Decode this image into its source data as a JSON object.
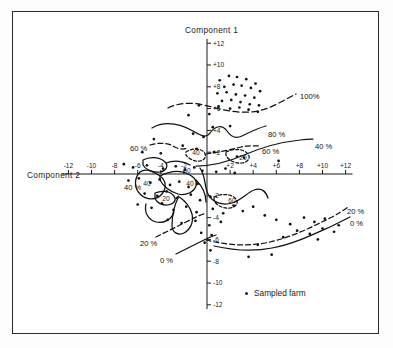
{
  "figure": {
    "axis_title_y": "Component 1",
    "axis_title_x": "Component 2",
    "legend_label": "Sampled farm",
    "legend_marker": "dot-marker"
  },
  "chart_data": {
    "type": "scatter",
    "title": "",
    "xlabel": "Component 2",
    "ylabel": "Component 1",
    "xlim": [
      -13,
      13
    ],
    "ylim": [
      -13,
      13
    ],
    "grid": false,
    "legend_position": "bottom-center",
    "legend": [
      {
        "label": "Sampled farm",
        "marker": "dot",
        "color": "#111111"
      }
    ],
    "x_ticks": [
      -12,
      -10,
      -8,
      -6,
      -4,
      -2,
      2,
      4,
      6,
      8,
      10,
      12
    ],
    "x_tick_labels": [
      "-12",
      "-10",
      "-8",
      "-6",
      "-4",
      "-2",
      "+2",
      "+4",
      "+6",
      "+8",
      "+10",
      "+12"
    ],
    "y_ticks": [
      -12,
      -10,
      -8,
      -6,
      -4,
      -2,
      2,
      4,
      6,
      8,
      10,
      12
    ],
    "y_tick_labels": [
      "-12",
      "-10",
      "-8",
      "-6",
      "-4",
      "-2",
      "+2",
      "+4",
      "+6",
      "+8",
      "+10",
      "+12"
    ],
    "series": [
      {
        "name": "Sampled farm",
        "marker": "dot",
        "points": [
          [
            1.1,
            8.6
          ],
          [
            1.9,
            9.0
          ],
          [
            2.6,
            8.9
          ],
          [
            3.4,
            8.7
          ],
          [
            4.2,
            8.3
          ],
          [
            1.5,
            8.0
          ],
          [
            2.3,
            8.2
          ],
          [
            3.0,
            8.1
          ],
          [
            3.8,
            7.9
          ],
          [
            4.6,
            7.6
          ],
          [
            0.9,
            7.4
          ],
          [
            1.7,
            7.5
          ],
          [
            2.5,
            7.3
          ],
          [
            3.3,
            7.2
          ],
          [
            4.1,
            7.0
          ],
          [
            1.3,
            6.7
          ],
          [
            2.1,
            6.8
          ],
          [
            2.9,
            6.6
          ],
          [
            3.7,
            6.4
          ],
          [
            4.5,
            6.3
          ],
          [
            2.0,
            6.0
          ],
          [
            2.8,
            6.1
          ],
          [
            3.6,
            5.9
          ],
          [
            4.4,
            5.7
          ],
          [
            1.0,
            6.2
          ],
          [
            -0.7,
            6.3
          ],
          [
            -1.6,
            5.4
          ],
          [
            0.2,
            5.5
          ],
          [
            0.5,
            4.3
          ],
          [
            2.0,
            4.4
          ],
          [
            -1.2,
            3.7
          ],
          [
            -0.3,
            3.4
          ],
          [
            -4.6,
            3.2
          ],
          [
            -2.1,
            2.6
          ],
          [
            -5.6,
            2.0
          ],
          [
            -4.0,
            1.9
          ],
          [
            -0.9,
            2.3
          ],
          [
            0.6,
            2.0
          ],
          [
            2.6,
            1.6
          ],
          [
            3.2,
            1.5
          ],
          [
            6.2,
            1.2
          ],
          [
            -7.2,
            0.9
          ],
          [
            -6.4,
            0.6
          ],
          [
            -5.2,
            0.8
          ],
          [
            -3.8,
            0.5
          ],
          [
            -2.7,
            0.7
          ],
          [
            -1.9,
            0.4
          ],
          [
            -1.1,
            0.6
          ],
          [
            -0.4,
            0.3
          ],
          [
            0.8,
            0.2
          ],
          [
            1.6,
            0.5
          ],
          [
            2.4,
            0.1
          ],
          [
            -6.8,
            -0.6
          ],
          [
            -5.9,
            -0.4
          ],
          [
            -4.9,
            -0.8
          ],
          [
            -4.1,
            -0.5
          ],
          [
            -3.2,
            -1.0
          ],
          [
            -2.4,
            -0.7
          ],
          [
            -1.6,
            -1.2
          ],
          [
            -0.8,
            -0.9
          ],
          [
            -5.4,
            -1.8
          ],
          [
            -4.3,
            -2.0
          ],
          [
            -3.5,
            -1.6
          ],
          [
            -2.6,
            -2.2
          ],
          [
            -1.4,
            -1.9
          ],
          [
            -0.6,
            -2.4
          ],
          [
            0.3,
            -2.1
          ],
          [
            -6.0,
            -2.8
          ],
          [
            -4.8,
            -3.1
          ],
          [
            -3.9,
            -2.7
          ],
          [
            -2.9,
            -3.3
          ],
          [
            -1.8,
            -3.0
          ],
          [
            -0.9,
            -3.5
          ],
          [
            0.5,
            -3.2
          ],
          [
            1.4,
            -3.6
          ],
          [
            2.3,
            -2.9
          ],
          [
            3.1,
            -3.4
          ],
          [
            4.0,
            -3.0
          ],
          [
            -3.4,
            -4.2
          ],
          [
            -2.2,
            -4.5
          ],
          [
            -1.0,
            -4.3
          ],
          [
            0.2,
            -4.7
          ],
          [
            1.2,
            -4.4
          ],
          [
            5.0,
            -3.8
          ],
          [
            6.0,
            -4.2
          ],
          [
            -0.5,
            -5.4
          ],
          [
            0.4,
            -5.6
          ],
          [
            -0.2,
            -6.3
          ],
          [
            0.3,
            -7.0
          ],
          [
            7.2,
            -4.6
          ],
          [
            8.4,
            -4.0
          ],
          [
            9.3,
            -4.4
          ],
          [
            10.2,
            -4.1
          ],
          [
            7.8,
            -5.2
          ],
          [
            8.9,
            -5.5
          ],
          [
            10.0,
            -5.0
          ],
          [
            11.0,
            -5.3
          ],
          [
            6.6,
            -5.8
          ],
          [
            9.6,
            -6.0
          ],
          [
            11.4,
            -4.7
          ],
          [
            3.6,
            -7.6
          ],
          [
            5.6,
            -7.4
          ],
          [
            4.4,
            -6.5
          ]
        ]
      }
    ],
    "contours": [
      {
        "label": "100%",
        "style": "dashed",
        "label_x": 300,
        "label_y": 92
      },
      {
        "label": "80 %",
        "style": "solid",
        "label_x": 268,
        "label_y": 130
      },
      {
        "label": "60 %",
        "style": "dashed",
        "label_x": 262,
        "label_y": 147
      },
      {
        "label": "40 %",
        "style": "solid",
        "label_x": 315,
        "label_y": 142
      },
      {
        "label": "60 %",
        "style": "dashed",
        "label_x": 130,
        "label_y": 144
      },
      {
        "label": "40 %",
        "style": "solid",
        "label_x": 124,
        "label_y": 183
      },
      {
        "label": "20 %",
        "style": "dashed",
        "label_x": 140,
        "label_y": 239
      },
      {
        "label": "0 %",
        "style": "solid",
        "label_x": 160,
        "label_y": 256
      },
      {
        "label": "20 %",
        "style": "dashed",
        "label_x": 347,
        "label_y": 207
      },
      {
        "label": "0 %",
        "style": "solid",
        "label_x": 350,
        "label_y": 219
      }
    ],
    "inline_contour_labels": [
      {
        "text": "40",
        "x": 196,
        "y": 155
      },
      {
        "text": "60",
        "x": 187,
        "y": 173
      },
      {
        "text": "40",
        "x": 147,
        "y": 186
      },
      {
        "text": "40",
        "x": 190,
        "y": 186
      },
      {
        "text": "20",
        "x": 166,
        "y": 201
      },
      {
        "text": "20",
        "x": 243,
        "y": 160
      },
      {
        "text": "60",
        "x": 232,
        "y": 203
      }
    ]
  }
}
